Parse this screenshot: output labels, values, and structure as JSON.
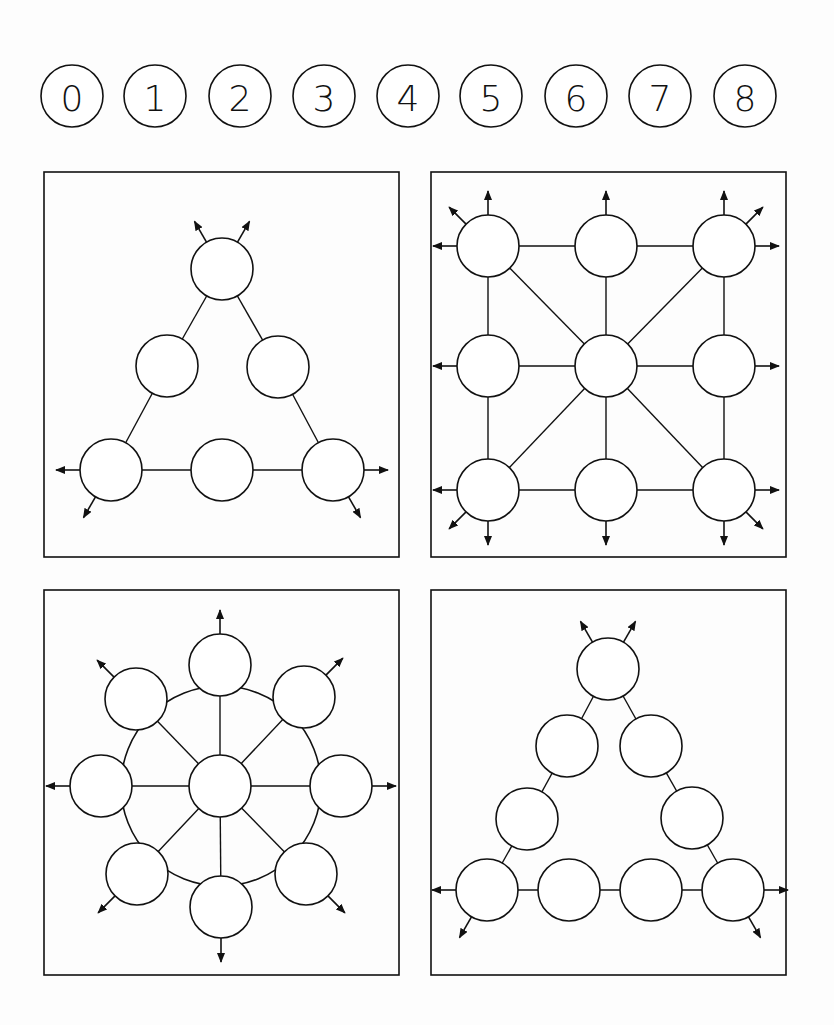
{
  "digits": {
    "labels": [
      "0",
      "1",
      "2",
      "3",
      "4",
      "5",
      "6",
      "7",
      "8"
    ],
    "cx": [
      72,
      155,
      240,
      324,
      408,
      491,
      576,
      660,
      745
    ],
    "cy": 96,
    "r": 31
  },
  "stroke_color": "#111111",
  "node_radius": 31,
  "panels": [
    {
      "name": "triangle-6",
      "box": [
        44,
        172,
        355,
        385
      ],
      "nodes": [
        [
          222,
          269
        ],
        [
          167,
          366
        ],
        [
          278,
          367
        ],
        [
          111,
          470
        ],
        [
          222,
          470
        ],
        [
          333,
          470
        ]
      ],
      "edges": [
        [
          0,
          1
        ],
        [
          0,
          2
        ],
        [
          1,
          3
        ],
        [
          2,
          5
        ],
        [
          3,
          4
        ],
        [
          4,
          5
        ]
      ],
      "arrows": [
        [
          0,
          -120
        ],
        [
          0,
          -60
        ],
        [
          3,
          180
        ],
        [
          3,
          120
        ],
        [
          5,
          0
        ],
        [
          5,
          60
        ]
      ]
    },
    {
      "name": "grid-9",
      "box": [
        431,
        172,
        355,
        385
      ],
      "nodes": [
        [
          488,
          246
        ],
        [
          606,
          246
        ],
        [
          724,
          246
        ],
        [
          488,
          366
        ],
        [
          606,
          366
        ],
        [
          724,
          366
        ],
        [
          488,
          490
        ],
        [
          606,
          490
        ],
        [
          724,
          490
        ]
      ],
      "edges": [
        [
          0,
          1
        ],
        [
          1,
          2
        ],
        [
          3,
          4
        ],
        [
          4,
          5
        ],
        [
          6,
          7
        ],
        [
          7,
          8
        ],
        [
          0,
          3
        ],
        [
          3,
          6
        ],
        [
          1,
          4
        ],
        [
          4,
          7
        ],
        [
          2,
          5
        ],
        [
          5,
          8
        ],
        [
          0,
          4
        ],
        [
          2,
          4
        ],
        [
          6,
          4
        ],
        [
          8,
          4
        ]
      ],
      "arrows": [
        [
          0,
          -135
        ],
        [
          0,
          -90
        ],
        [
          0,
          180
        ],
        [
          1,
          -90
        ],
        [
          2,
          -90
        ],
        [
          2,
          -45
        ],
        [
          2,
          0
        ],
        [
          3,
          180
        ],
        [
          5,
          0
        ],
        [
          6,
          180
        ],
        [
          6,
          135
        ],
        [
          6,
          90
        ],
        [
          7,
          90
        ],
        [
          8,
          90
        ],
        [
          8,
          45
        ],
        [
          8,
          0
        ]
      ]
    },
    {
      "name": "wheel-9",
      "box": [
        44,
        590,
        355,
        385
      ],
      "nodes": [
        [
          220,
          665
        ],
        [
          136,
          699
        ],
        [
          304,
          697
        ],
        [
          101,
          786
        ],
        [
          220,
          786
        ],
        [
          341,
          786
        ],
        [
          137,
          874
        ],
        [
          306,
          874
        ],
        [
          221,
          907
        ]
      ],
      "edges": [
        [
          0,
          4
        ],
        [
          1,
          4
        ],
        [
          2,
          4
        ],
        [
          3,
          4
        ],
        [
          5,
          4
        ],
        [
          6,
          4
        ],
        [
          7,
          4
        ],
        [
          8,
          4
        ]
      ],
      "ring": [
        221,
        786,
        100
      ],
      "arrows": [
        [
          0,
          -90
        ],
        [
          1,
          -135
        ],
        [
          2,
          -45
        ],
        [
          3,
          180
        ],
        [
          5,
          0
        ],
        [
          6,
          135
        ],
        [
          7,
          45
        ],
        [
          8,
          90
        ]
      ]
    },
    {
      "name": "triangle-9",
      "box": [
        431,
        590,
        355,
        385
      ],
      "nodes": [
        [
          608,
          669
        ],
        [
          567,
          746
        ],
        [
          651,
          746
        ],
        [
          527,
          819
        ],
        [
          692,
          818
        ],
        [
          487,
          890
        ],
        [
          569,
          890
        ],
        [
          651,
          890
        ],
        [
          733,
          890
        ]
      ],
      "edges": [
        [
          0,
          1
        ],
        [
          0,
          2
        ],
        [
          1,
          3
        ],
        [
          2,
          4
        ],
        [
          3,
          5
        ],
        [
          4,
          8
        ],
        [
          5,
          6
        ],
        [
          6,
          7
        ],
        [
          7,
          8
        ]
      ],
      "arrows": [
        [
          0,
          -120
        ],
        [
          0,
          -60
        ],
        [
          5,
          180
        ],
        [
          5,
          120
        ],
        [
          8,
          0
        ],
        [
          8,
          60
        ]
      ]
    }
  ]
}
